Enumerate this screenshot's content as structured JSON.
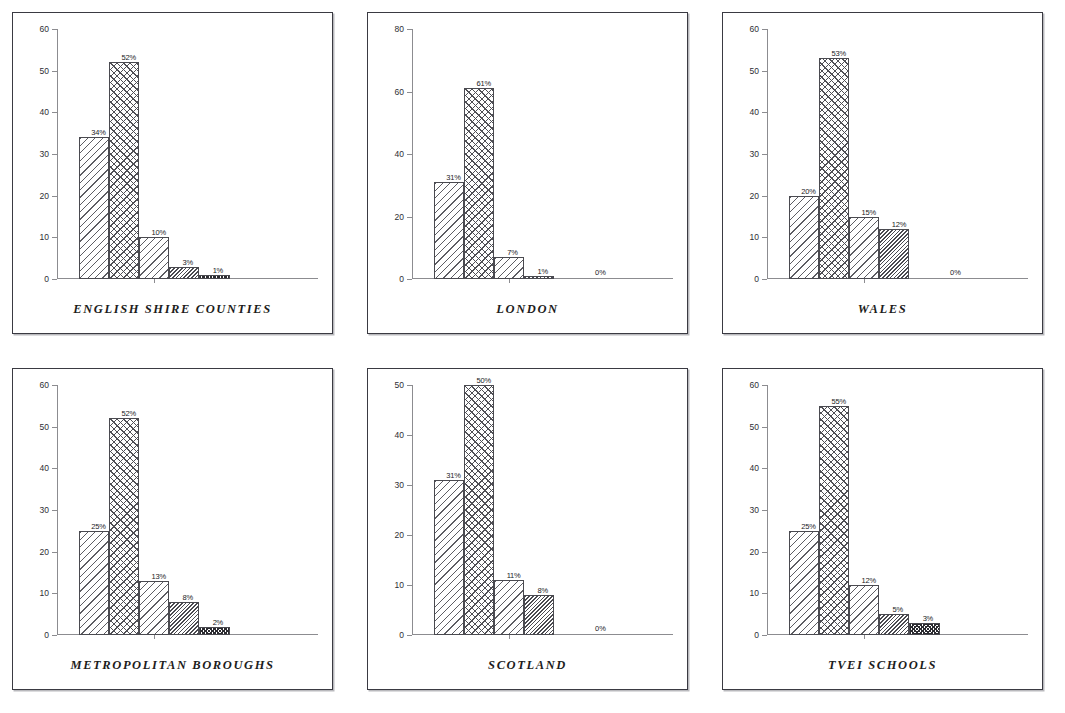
{
  "figure": {
    "background_color": "#ffffff",
    "panel_border_color": "#3a3a42",
    "panel_count": 6,
    "layout": "2 rows x 3 columns"
  },
  "series_patterns": [
    "diagonal-hatch",
    "cross-hatch",
    "diagonal-hatch",
    "dense-diagonal-hatch",
    "dense-dark-cross-hatch"
  ],
  "chart_data": [
    {
      "type": "bar",
      "title": "ENGLISH SHIRE COUNTIES",
      "xlabel": "",
      "ylabel": "",
      "ylim": [
        0,
        60
      ],
      "yticks": [
        0,
        10,
        20,
        30,
        40,
        50,
        60
      ],
      "ytick_labels": [
        "0",
        "10",
        "20",
        "30",
        "40",
        "50",
        "60"
      ],
      "grid": false,
      "legend": "none",
      "categories": [
        "1",
        "2",
        "3",
        "4",
        "5"
      ],
      "values": [
        34,
        52,
        10,
        3,
        1
      ],
      "data_labels": [
        "34%",
        "52%",
        "10%",
        "3%",
        "1%"
      ]
    },
    {
      "type": "bar",
      "title": "LONDON",
      "xlabel": "",
      "ylabel": "",
      "ylim": [
        0,
        80
      ],
      "yticks": [
        0,
        20,
        40,
        60,
        80
      ],
      "ytick_labels": [
        "0",
        "20",
        "40",
        "60",
        "80"
      ],
      "grid": false,
      "legend": "none",
      "categories": [
        "1",
        "2",
        "3",
        "4",
        "5"
      ],
      "values": [
        31,
        61,
        7,
        1,
        0
      ],
      "data_labels": [
        "31%",
        "61%",
        "7%",
        "1%",
        "0%"
      ]
    },
    {
      "type": "bar",
      "title": "WALES",
      "xlabel": "",
      "ylabel": "",
      "ylim": [
        0,
        60
      ],
      "yticks": [
        0,
        10,
        20,
        30,
        40,
        50,
        60
      ],
      "ytick_labels": [
        "0",
        "10",
        "20",
        "30",
        "40",
        "50",
        "60"
      ],
      "grid": false,
      "legend": "none",
      "categories": [
        "1",
        "2",
        "3",
        "4",
        "5"
      ],
      "values": [
        20,
        53,
        15,
        12,
        0
      ],
      "data_labels": [
        "20%",
        "53%",
        "15%",
        "12%",
        "0%"
      ]
    },
    {
      "type": "bar",
      "title": "METROPOLITAN BOROUGHS",
      "xlabel": "",
      "ylabel": "",
      "ylim": [
        0,
        60
      ],
      "yticks": [
        0,
        10,
        20,
        30,
        40,
        50,
        60
      ],
      "ytick_labels": [
        "0",
        "10",
        "20",
        "30",
        "40",
        "50",
        "60"
      ],
      "grid": false,
      "legend": "none",
      "categories": [
        "1",
        "2",
        "3",
        "4",
        "5"
      ],
      "values": [
        25,
        52,
        13,
        8,
        2
      ],
      "data_labels": [
        "25%",
        "52%",
        "13%",
        "8%",
        "2%"
      ]
    },
    {
      "type": "bar",
      "title": "SCOTLAND",
      "xlabel": "",
      "ylabel": "",
      "ylim": [
        0,
        50
      ],
      "yticks": [
        0,
        10,
        20,
        30,
        40,
        50
      ],
      "ytick_labels": [
        "0",
        "10",
        "20",
        "30",
        "40",
        "50"
      ],
      "grid": false,
      "legend": "none",
      "categories": [
        "1",
        "2",
        "3",
        "4",
        "5"
      ],
      "values": [
        31,
        50,
        11,
        8,
        0
      ],
      "data_labels": [
        "31%",
        "50%",
        "11%",
        "8%",
        "0%"
      ]
    },
    {
      "type": "bar",
      "title": "TVEI SCHOOLS",
      "xlabel": "",
      "ylabel": "",
      "ylim": [
        0,
        60
      ],
      "yticks": [
        0,
        10,
        20,
        30,
        40,
        50,
        60
      ],
      "ytick_labels": [
        "0",
        "10",
        "20",
        "30",
        "40",
        "50",
        "60"
      ],
      "grid": false,
      "legend": "none",
      "categories": [
        "1",
        "2",
        "3",
        "4",
        "5"
      ],
      "values": [
        25,
        55,
        12,
        5,
        3
      ],
      "data_labels": [
        "25%",
        "55%",
        "12%",
        "5%",
        "3%"
      ]
    }
  ]
}
